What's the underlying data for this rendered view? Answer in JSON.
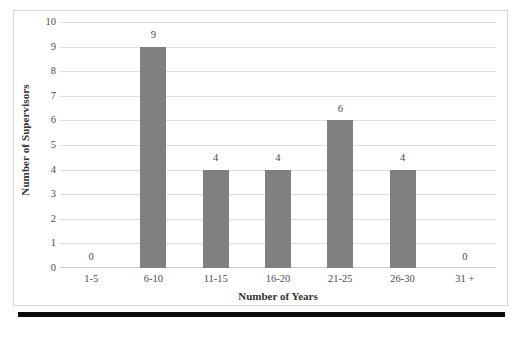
{
  "chart_data": {
    "type": "bar",
    "title": "",
    "subtitle": "",
    "xlabel": "Number of Years",
    "ylabel": "Number of Supervisors",
    "categories": [
      "1-5",
      "6-10",
      "11-15",
      "16-20",
      "21-25",
      "26-30",
      "31 +"
    ],
    "values": [
      0,
      9,
      4,
      4,
      6,
      4,
      0
    ],
    "data_labels": [
      "0",
      "9",
      "4",
      "4",
      "6",
      "4",
      "0"
    ],
    "ylim": [
      0,
      10
    ],
    "y_ticks": [
      "10",
      "9",
      "8",
      "7",
      "6",
      "5",
      "4",
      "3",
      "2",
      "1",
      "0"
    ],
    "y_tick_values": [
      10,
      9,
      8,
      7,
      6,
      5,
      4,
      3,
      2,
      1,
      0
    ],
    "grid": "horizontal",
    "legend": "none",
    "bar_color": "#808080",
    "gridline_color": "#dddddd",
    "axis_color": "#c9c9c9",
    "frame_color": "#d6d6d6",
    "text_color": "#4a4a4a",
    "rule_color": "#0a0a0a"
  }
}
